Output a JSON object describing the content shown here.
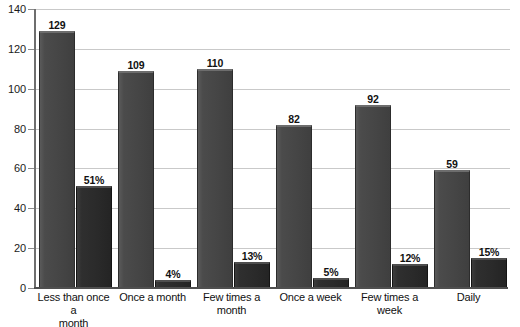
{
  "chart_data": {
    "type": "bar",
    "title": "",
    "subtitle": "",
    "xlabel": "",
    "ylabel": "",
    "ylim": [
      0,
      140
    ],
    "ytick_step": 20,
    "yticks": [
      0,
      20,
      40,
      60,
      80,
      100,
      120,
      140
    ],
    "ytick_labels": [
      "0",
      "20",
      "40",
      "60",
      "80",
      "100",
      "120",
      "140"
    ],
    "grid": true,
    "legend": "none",
    "categories": [
      "Less than once a month",
      "Once a month",
      "Few times a month",
      "Once a week",
      "Few times a week",
      "Daily"
    ],
    "series": [
      {
        "name": "count",
        "values": [
          129,
          109,
          110,
          82,
          92,
          59
        ],
        "labels": [
          "129",
          "109",
          "110",
          "82",
          "92",
          "59"
        ],
        "color": "#454545"
      },
      {
        "name": "percent",
        "values": [
          51,
          4,
          13,
          5,
          12,
          15
        ],
        "labels": [
          "51%",
          "4%",
          "13%",
          "5%",
          "12%",
          "15%"
        ],
        "color": "#2a2a2a"
      }
    ]
  },
  "axis": {
    "y_tick_labels": [
      "140",
      "120",
      "100",
      "80",
      "60",
      "40",
      "20",
      "0"
    ]
  },
  "category_labels": [
    {
      "line1": "Less than once a",
      "line2": "month"
    },
    {
      "line1": "Once a month",
      "line2": ""
    },
    {
      "line1": "Few times a month",
      "line2": ""
    },
    {
      "line1": "Once a week",
      "line2": ""
    },
    {
      "line1": "Few times a week",
      "line2": ""
    },
    {
      "line1": "Daily",
      "line2": ""
    }
  ],
  "colors": {
    "count_bar": "#454545",
    "percent_bar": "#2a2a2a",
    "gridline": "#c9c9c9",
    "axis": "#4f4f4f",
    "background": "#ffffff",
    "text": "#111111"
  }
}
